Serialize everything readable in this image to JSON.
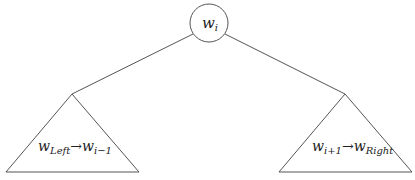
{
  "diagram": {
    "root": {
      "base": "w",
      "sub": "i"
    },
    "left_subtree": {
      "from_base": "w",
      "from_sub": "Left",
      "arrow": "→",
      "to_base": "w",
      "to_sub": "i−1"
    },
    "right_subtree": {
      "from_base": "w",
      "from_sub": "i+1",
      "arrow": "→",
      "to_base": "w",
      "to_sub": "Right"
    },
    "colors": {
      "stroke": "#555555",
      "text": "#222222",
      "background": "#ffffff"
    }
  }
}
